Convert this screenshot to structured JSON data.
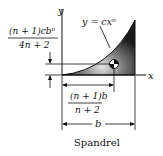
{
  "diagram": {
    "title": "Spandrel",
    "curve_label": "y = cxⁿ",
    "axis_x_label": "x",
    "axis_y_label": "y",
    "ybar_label": {
      "numerator": "(n + 1)cbⁿ",
      "denominator": "4n + 2"
    },
    "xbar_label": {
      "numerator": "(n + 1)b",
      "denominator": "n + 2"
    },
    "width_label": "b",
    "centroid_icon": "centroid-symbol",
    "colors": {
      "fill_dark": "#1a1a1a",
      "fill_light": "#d8d8d8",
      "line": "#111111"
    }
  }
}
